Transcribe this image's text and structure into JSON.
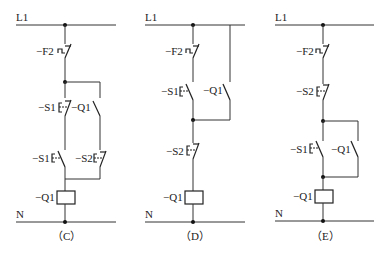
{
  "diagrams": [
    {
      "caption": "（C）",
      "rail_top": "L1",
      "rail_bottom": "N",
      "labels": {
        "f2": "−F2",
        "s1_nc": "−S1",
        "q1_contact": "−Q1",
        "s1_no": "−S1",
        "s2_nc": "−S2",
        "q1_coil": "−Q1"
      }
    },
    {
      "caption": "（D）",
      "rail_top": "L1",
      "rail_bottom": "N",
      "labels": {
        "f2": "−F2",
        "s1_no": "−S1",
        "q1_contact": "−Q1",
        "s2_nc": "−S2",
        "q1_coil": "−Q1"
      }
    },
    {
      "caption": "（E）",
      "rail_top": "L1",
      "rail_bottom": "N",
      "labels": {
        "f2": "−F2",
        "s2_nc": "−S2",
        "s1_no": "−S1",
        "q1_contact": "−Q1",
        "q1_coil": "−Q1"
      }
    }
  ]
}
